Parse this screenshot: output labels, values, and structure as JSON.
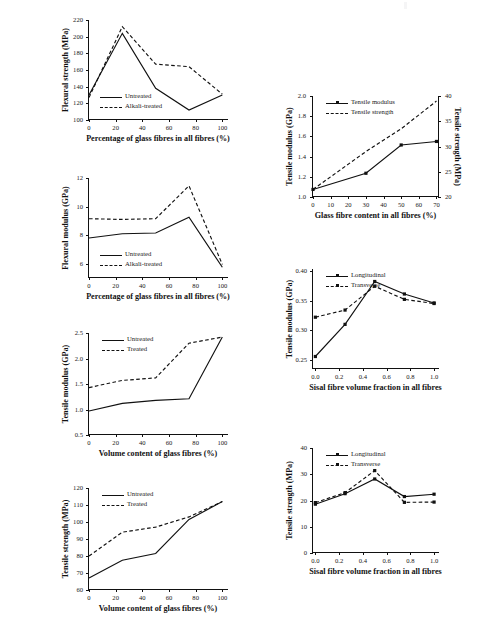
{
  "page": {
    "background": "#ffffff",
    "line_color": "#111111"
  },
  "charts": [
    {
      "id": "flexural-strength-glass",
      "position": {
        "left": 55,
        "top": 14,
        "width": 180,
        "height": 128
      },
      "plot": {
        "left": 33,
        "top": 6,
        "width": 140,
        "height": 100
      },
      "chart_data": {
        "type": "line",
        "title": "",
        "xlabel": "Percentage of glass fibres in all fibres (%)",
        "ylabel": "Flexural strength (MPa)",
        "xlim": [
          0,
          105
        ],
        "ylim": [
          100,
          220
        ],
        "xticks": [
          0,
          20,
          40,
          60,
          80,
          100
        ],
        "xticklabels": [
          "0",
          "20",
          "40",
          "60",
          "80",
          "100"
        ],
        "yticks": [
          100,
          120,
          140,
          160,
          180,
          200,
          220
        ],
        "yticklabels": [
          "100",
          "120",
          "140",
          "160",
          "180",
          "200",
          "220"
        ],
        "grid": false,
        "legend_position": "lower-left-inside",
        "x": [
          0,
          25,
          50,
          75,
          100
        ],
        "series": [
          {
            "name": "Untreated",
            "style": "solid",
            "marker": "none",
            "values": [
              130,
              204,
              138,
              112,
              130
            ]
          },
          {
            "name": "Alkali-treated",
            "style": "dashed",
            "marker": "none",
            "values": [
              127,
              212,
              167,
              164,
              131
            ]
          }
        ]
      }
    },
    {
      "id": "flexural-modulus-glass",
      "position": {
        "left": 55,
        "top": 172,
        "width": 180,
        "height": 128
      },
      "plot": {
        "left": 33,
        "top": 6,
        "width": 140,
        "height": 100
      },
      "chart_data": {
        "type": "line",
        "title": "",
        "xlabel": "Percentage of glass fibres in all fibres (%)",
        "ylabel": "Flexural modulus (GPa)",
        "xlim": [
          0,
          105
        ],
        "ylim": [
          5,
          12
        ],
        "xticks": [
          0,
          20,
          40,
          60,
          80,
          100
        ],
        "xticklabels": [
          "0",
          "20",
          "40",
          "60",
          "80",
          "100"
        ],
        "yticks": [
          6,
          8,
          10,
          12
        ],
        "yticklabels": [
          "6",
          "8",
          "10",
          "12"
        ],
        "grid": false,
        "legend_position": "lower-left-inside",
        "x": [
          0,
          25,
          50,
          75,
          100
        ],
        "series": [
          {
            "name": "Untreated",
            "style": "solid",
            "marker": "none",
            "values": [
              7.8,
              8.1,
              8.15,
              9.25,
              5.75
            ]
          },
          {
            "name": "Alkali-treated",
            "style": "dashed",
            "marker": "none",
            "values": [
              9.15,
              9.1,
              9.15,
              11.45,
              5.95
            ]
          }
        ]
      }
    },
    {
      "id": "tensile-modulus-glass-volume",
      "position": {
        "left": 55,
        "top": 327,
        "width": 180,
        "height": 130
      },
      "plot": {
        "left": 33,
        "top": 6,
        "width": 140,
        "height": 102
      },
      "chart_data": {
        "type": "line",
        "title": "",
        "xlabel": "Volume content of glass fibres (%)",
        "ylabel": "Tensile modulus (GPa)",
        "xlim": [
          0,
          105
        ],
        "ylim": [
          0.5,
          2.5
        ],
        "xticks": [
          0,
          20,
          40,
          60,
          80,
          100
        ],
        "xticklabels": [
          "0",
          "20",
          "40",
          "60",
          "80",
          "100"
        ],
        "yticks": [
          0.5,
          1.0,
          1.5,
          2.0,
          2.5
        ],
        "yticklabels": [
          "0.5",
          "1.0",
          "1.5",
          "2.0",
          "2.5"
        ],
        "grid": false,
        "legend_position": "upper-left-inside",
        "x": [
          0,
          25,
          50,
          75,
          100
        ],
        "series": [
          {
            "name": "Untreated",
            "style": "solid",
            "marker": "none",
            "values": [
              0.97,
              1.12,
              1.18,
              1.21,
              2.42
            ]
          },
          {
            "name": "Treated",
            "style": "dashed",
            "marker": "none",
            "values": [
              1.43,
              1.57,
              1.62,
              2.3,
              2.42
            ]
          }
        ]
      }
    },
    {
      "id": "tensile-strength-glass-volume",
      "position": {
        "left": 55,
        "top": 482,
        "width": 180,
        "height": 130
      },
      "plot": {
        "left": 33,
        "top": 6,
        "width": 140,
        "height": 102
      },
      "chart_data": {
        "type": "line",
        "title": "",
        "xlabel": "Volume content of glass fibres (%)",
        "ylabel": "Tensile strength (MPa)",
        "xlim": [
          0,
          105
        ],
        "ylim": [
          60,
          120
        ],
        "xticks": [
          0,
          20,
          40,
          60,
          80,
          100
        ],
        "xticklabels": [
          "0",
          "20",
          "40",
          "60",
          "80",
          "100"
        ],
        "yticks": [
          60,
          70,
          80,
          90,
          100,
          110,
          120
        ],
        "yticklabels": [
          "60",
          "70",
          "80",
          "90",
          "100",
          "110",
          "120"
        ],
        "grid": false,
        "legend_position": "upper-left-inside",
        "x": [
          0,
          25,
          50,
          75,
          100
        ],
        "series": [
          {
            "name": "Untreated",
            "style": "solid",
            "marker": "none",
            "values": [
              67,
              77.5,
              81.5,
              101.5,
              112
            ]
          },
          {
            "name": "Treated",
            "style": "dashed",
            "marker": "none",
            "values": [
              80,
              94,
              97,
              103,
              112
            ]
          }
        ]
      }
    },
    {
      "id": "tensile-modulus-strength-glass-content",
      "position": {
        "left": 276,
        "top": 88,
        "width": 195,
        "height": 135
      },
      "plot": {
        "left": 36,
        "top": 8,
        "width": 127,
        "height": 101
      },
      "chart_data": {
        "type": "line",
        "title": "",
        "xlabel": "Glass fibre content in all fibres (%)",
        "ylabel": "Tensile modulus (GPa)",
        "y2label": "Tensile strength (MPa)",
        "xlim": [
          0,
          72
        ],
        "ylim": [
          1.0,
          2.0
        ],
        "y2lim": [
          20,
          40
        ],
        "xticks": [
          0,
          10,
          20,
          30,
          40,
          50,
          60,
          70
        ],
        "xticklabels": [
          "0",
          "10",
          "20",
          "30",
          "40",
          "50",
          "60",
          "70"
        ],
        "yticks": [
          1.0,
          1.2,
          1.4,
          1.6,
          1.8,
          2.0
        ],
        "yticklabels": [
          "1.0",
          "1.2",
          "1.4",
          "1.6",
          "1.8",
          "2.0"
        ],
        "y2ticks": [
          20,
          25,
          30,
          35,
          40
        ],
        "y2ticklabels": [
          "20",
          "25",
          "30",
          "35",
          "40"
        ],
        "grid": false,
        "legend_position": "upper-left-inside",
        "x": [
          0,
          30,
          50,
          70
        ],
        "series": [
          {
            "name": "Tensile modulus",
            "style": "solid",
            "marker": "square",
            "axis": "left",
            "values": [
              1.075,
              1.235,
              1.515,
              1.55
            ]
          },
          {
            "name": "Tensile strength",
            "style": "dashed",
            "marker": "none",
            "axis": "right",
            "values": [
              21.5,
              29.0,
              33.5,
              39.0
            ]
          }
        ]
      }
    },
    {
      "id": "tensile-modulus-sisal-fraction",
      "position": {
        "left": 276,
        "top": 262,
        "width": 195,
        "height": 133
      },
      "plot": {
        "left": 36,
        "top": 7,
        "width": 127,
        "height": 100
      },
      "chart_data": {
        "type": "line",
        "title": "",
        "xlabel": "Sisal fibre volume fraction in all fibres",
        "ylabel": "Tensile modulus (GPa)",
        "xlim": [
          -0.02,
          1.05
        ],
        "ylim": [
          0.235,
          0.403
        ],
        "xticks": [
          0.0,
          0.2,
          0.4,
          0.6,
          0.8,
          1.0
        ],
        "xticklabels": [
          "0.0",
          "0.2",
          "0.4",
          "0.6",
          "0.8",
          "1.0"
        ],
        "yticks": [
          0.25,
          0.3,
          0.35,
          0.4
        ],
        "yticklabels": [
          "0.25",
          "0.30",
          "0.35",
          "0.40"
        ],
        "grid": false,
        "legend_position": "upper-left-inside",
        "x": [
          0.0,
          0.25,
          0.5,
          0.75,
          1.0
        ],
        "series": [
          {
            "name": "Longitudinal",
            "style": "solid",
            "marker": "square",
            "values": [
              0.256,
              0.31,
              0.382,
              0.361,
              0.346
            ]
          },
          {
            "name": "Transverse",
            "style": "dashed",
            "marker": "square",
            "values": [
              0.322,
              0.334,
              0.374,
              0.352,
              0.345
            ]
          }
        ]
      }
    },
    {
      "id": "tensile-strength-sisal-fraction",
      "position": {
        "left": 276,
        "top": 440,
        "width": 195,
        "height": 140
      },
      "plot": {
        "left": 36,
        "top": 8,
        "width": 127,
        "height": 105
      },
      "chart_data": {
        "type": "line",
        "title": "",
        "xlabel": "Sisal fibre volume fraction in all fibres",
        "ylabel": "Tensile strength (MPa)",
        "xlim": [
          -0.02,
          1.05
        ],
        "ylim": [
          0,
          40
        ],
        "xticks": [
          0.0,
          0.2,
          0.4,
          0.6,
          0.8,
          1.0
        ],
        "xticklabels": [
          "0.0",
          "0.2",
          "0.4",
          "0.6",
          "0.8",
          "1.0"
        ],
        "yticks": [
          0,
          10,
          20,
          30,
          40
        ],
        "yticklabels": [
          "0",
          "10",
          "20",
          "30",
          "40"
        ],
        "grid": false,
        "legend_position": "upper-left-inside",
        "x": [
          0.0,
          0.25,
          0.5,
          0.75,
          1.0
        ],
        "series": [
          {
            "name": "Longitudinal",
            "style": "solid",
            "marker": "square",
            "values": [
              18.6,
              22.6,
              28.2,
              21.5,
              22.4
            ]
          },
          {
            "name": "Transverse",
            "style": "dashed",
            "marker": "square",
            "values": [
              19.2,
              23.0,
              31.4,
              19.3,
              19.4
            ]
          }
        ]
      }
    }
  ]
}
